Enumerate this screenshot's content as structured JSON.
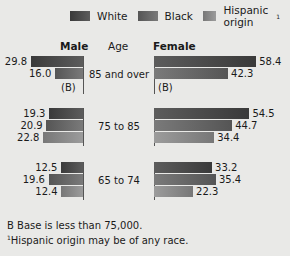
{
  "legend": [
    {
      "label": "White",
      "color": "#4a4a4a"
    },
    {
      "label": "Black",
      "color": "#6a6a6a"
    },
    {
      "label": "Hispanic origin",
      "sup": "1",
      "color": "#8a8a8a"
    }
  ],
  "headers": {
    "male": "Male",
    "age": "Age",
    "female": "Female"
  },
  "notes": {
    "base": "B Base is less than 75,000.",
    "hispanic_sup": "1",
    "hispanic": "Hispanic origin may be of any race."
  },
  "chart_data": {
    "type": "bar",
    "orientation": "horizontal-butterfly",
    "categories": [
      "85 and over",
      "75 to 85",
      "65 to 74"
    ],
    "groups": [
      "Male",
      "Female"
    ],
    "series": [
      {
        "name": "White",
        "male": [
          29.8,
          19.3,
          12.5
        ],
        "female": [
          58.4,
          54.5,
          33.2
        ]
      },
      {
        "name": "Black",
        "male": [
          16.0,
          20.9,
          19.6
        ],
        "female": [
          42.3,
          44.7,
          35.4
        ]
      },
      {
        "name": "Hispanic origin",
        "male": [
          null,
          22.8,
          12.4
        ],
        "female": [
          null,
          34.4,
          22.3
        ]
      }
    ],
    "labels": {
      "male": [
        [
          "29.8",
          "16.0",
          "(B)"
        ],
        [
          "19.3",
          "20.9",
          "22.8"
        ],
        [
          "12.5",
          "19.6",
          "12.4"
        ]
      ],
      "female": [
        [
          "58.4",
          "42.3",
          "(B)"
        ],
        [
          "54.5",
          "44.7",
          "34.4"
        ],
        [
          "33.2",
          "35.4",
          "22.3"
        ]
      ]
    },
    "legend_position": "top",
    "grid": false
  }
}
